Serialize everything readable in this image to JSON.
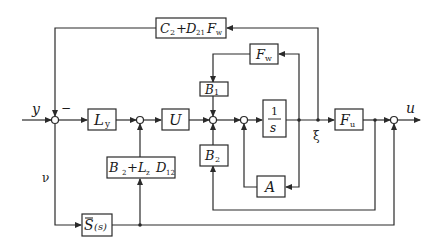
{
  "diagram": {
    "type": "control-system-block-diagram",
    "signals": {
      "input": "y",
      "output": "u",
      "state": "ξ",
      "residual": "ν",
      "minus_sign": "−"
    },
    "blocks": {
      "Ly": {
        "main": "L",
        "sub": "y"
      },
      "U": {
        "main": "U"
      },
      "B1": {
        "main": "B",
        "sub": "1"
      },
      "B2": {
        "main": "B",
        "sub": "2"
      },
      "integrator": {
        "num": "1",
        "den": "s"
      },
      "Fu": {
        "main": "F",
        "sub": "u"
      },
      "Fw": {
        "main": "F",
        "sub": "w"
      },
      "A": {
        "main": "A"
      },
      "C2D21Fw": {
        "text": "C₂+ D₂₁ F_w",
        "p1": "C",
        "p1sub": "2",
        "plus": "+",
        "p2": "D",
        "p2sub": "21",
        "p3": "F",
        "p3sub": "w"
      },
      "B2LzD12": {
        "text": "B₂+ L_z D₁₂",
        "p1": "B",
        "p1sub": "2",
        "plus": "+",
        "p2": "L",
        "p2sub": "z",
        "p3": "D",
        "p3sub": "12"
      },
      "Sbar": {
        "main": "S",
        "arg": "(s)"
      }
    },
    "summing_junctions": 5,
    "colors": {
      "line": "#2a2a2a",
      "background": "#ffffff"
    }
  }
}
